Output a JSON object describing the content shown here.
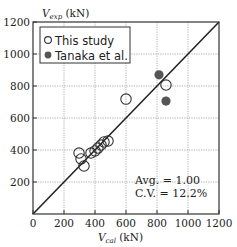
{
  "chart_data": {
    "type": "scatter",
    "title": "",
    "xlabel": "V_cal (kN)",
    "ylabel": "V_exp (kN)",
    "xlabel_main": "V",
    "xlabel_sub": "cal",
    "xlabel_unit": " (kN)",
    "ylabel_main": "V",
    "ylabel_sub": "exp",
    "ylabel_unit": " (kN)",
    "xlim": [
      0,
      1200
    ],
    "ylim": [
      0,
      1200
    ],
    "xticks": [
      0,
      200,
      400,
      600,
      800,
      1000,
      1200
    ],
    "yticks": [
      200,
      400,
      600,
      800,
      1000,
      1200
    ],
    "grid": true,
    "reference_line": {
      "label": "y = x",
      "from": [
        0,
        0
      ],
      "to": [
        1200,
        1200
      ]
    },
    "legend_position": "upper-left",
    "series": [
      {
        "name": "This study",
        "marker": "open-circle",
        "points": [
          [
            297,
            381
          ],
          [
            310,
            344
          ],
          [
            329,
            300
          ],
          [
            374,
            381
          ],
          [
            400,
            394
          ],
          [
            419,
            412
          ],
          [
            439,
            431
          ],
          [
            458,
            450
          ],
          [
            484,
            456
          ],
          [
            600,
            718
          ],
          [
            858,
            806
          ]
        ]
      },
      {
        "name": "Tanaka et al.",
        "marker": "filled-circle",
        "points": [
          [
            813,
            870
          ],
          [
            858,
            706
          ]
        ]
      }
    ],
    "annotations": [
      {
        "text": "Avg. = 1.00",
        "x": 800,
        "y": 190
      },
      {
        "text": "C.V. = 12.2%",
        "x": 800,
        "y": 105
      }
    ],
    "colors": {
      "open_marker_stroke": "#333333",
      "filled_marker": "#555555",
      "axis": "#333333",
      "grid": "#999999"
    }
  }
}
